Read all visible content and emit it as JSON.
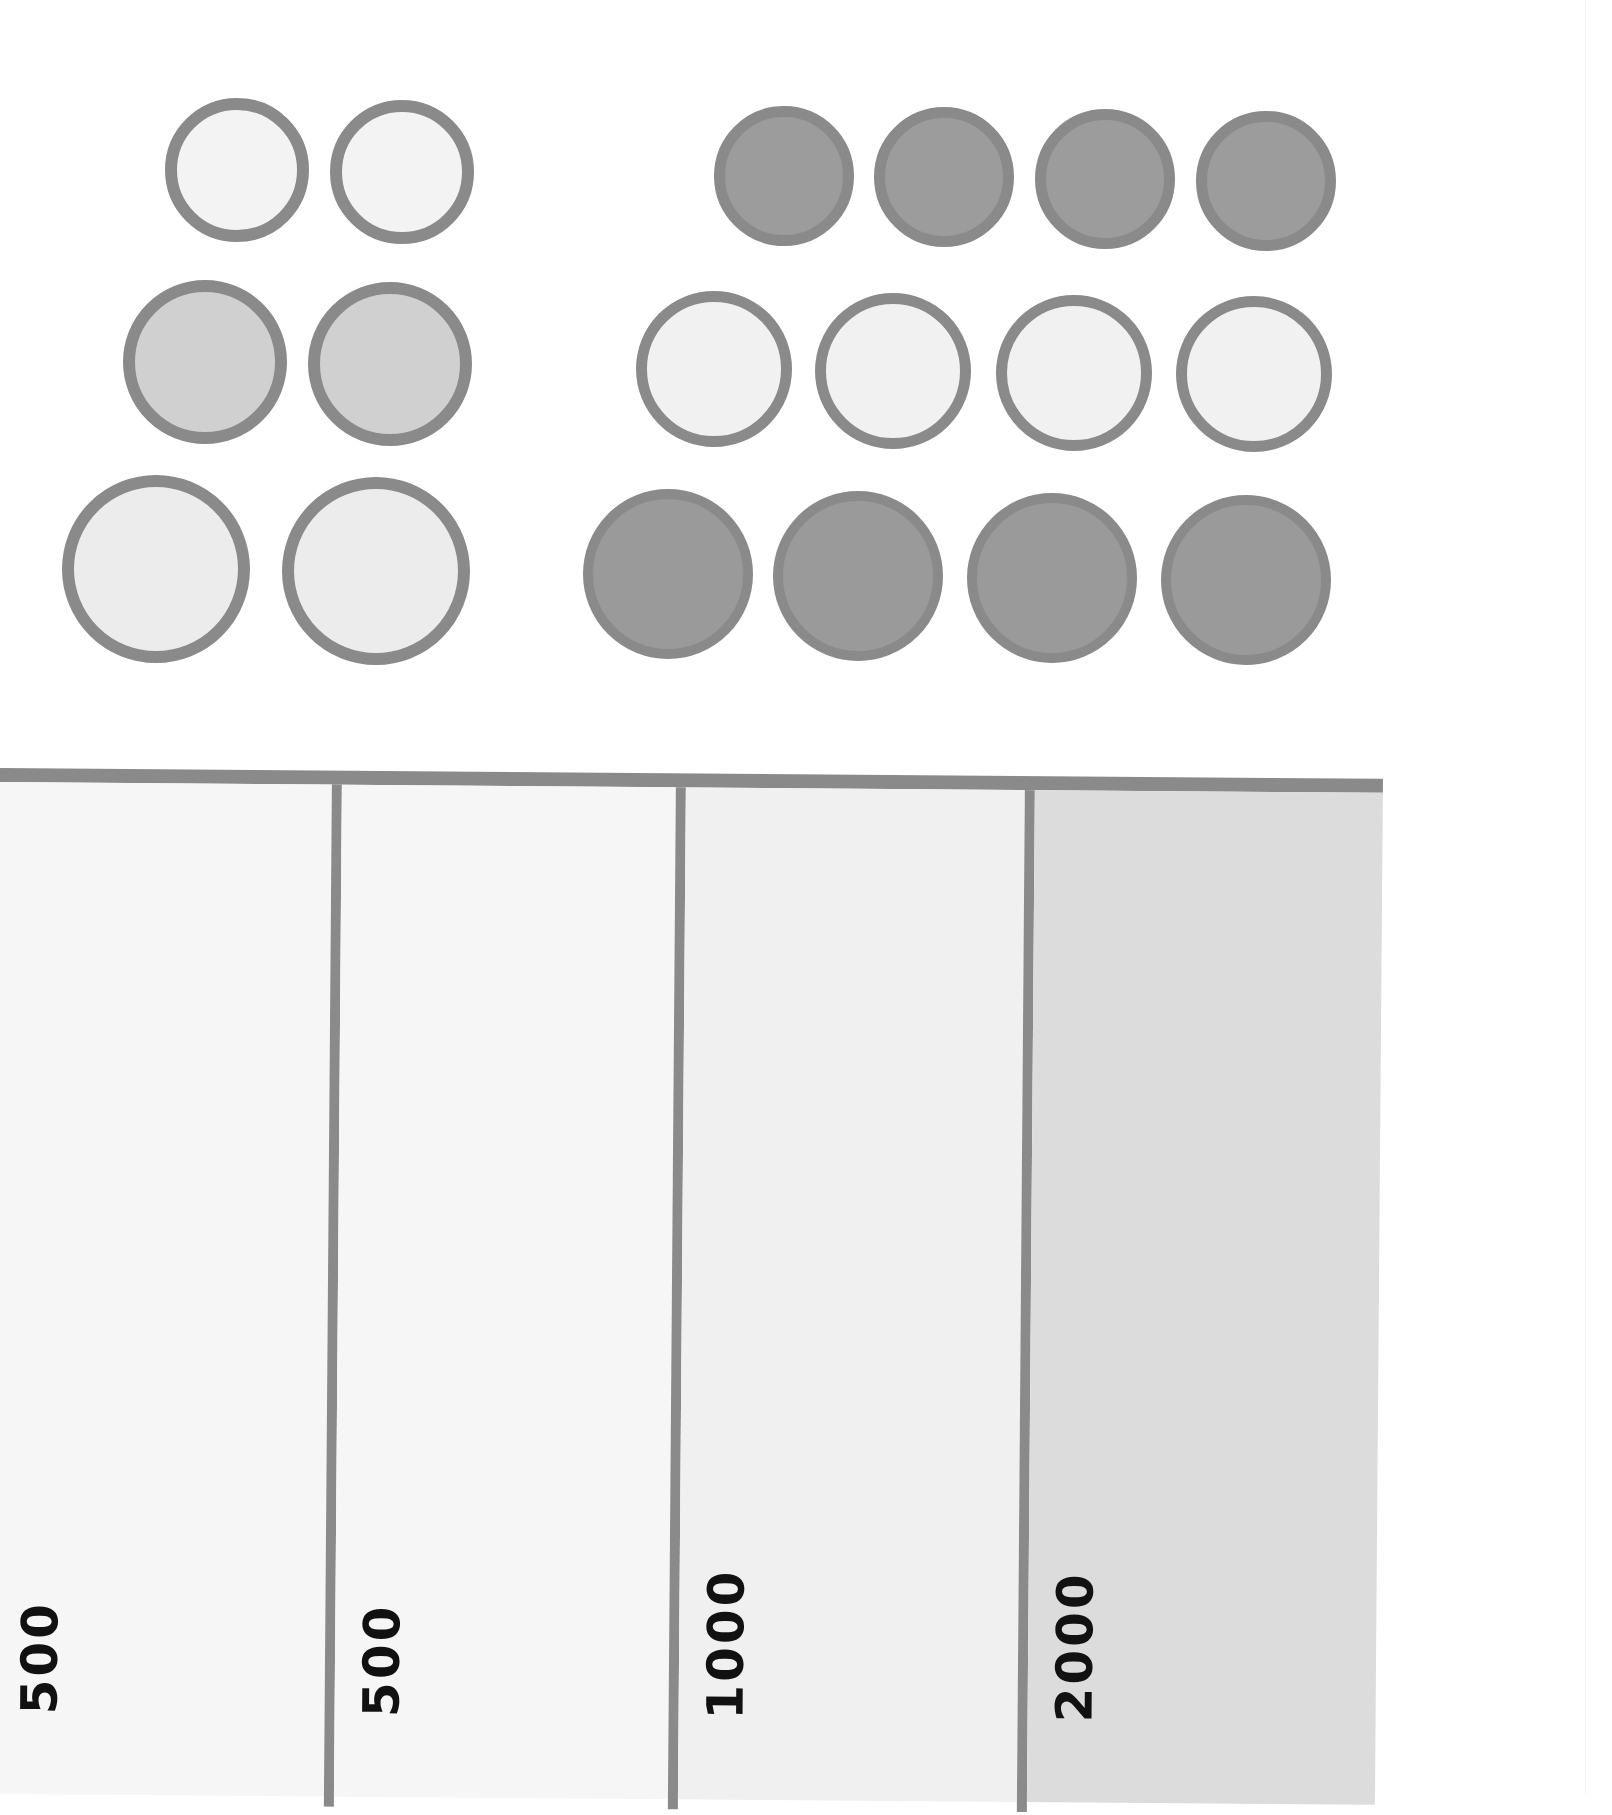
{
  "coins": {
    "border_color": "#8a8a8a",
    "left_group": [
      {
        "row": 1,
        "cx": 237,
        "cy": 170,
        "r": 72,
        "fill": "#f3f3f3",
        "border": 12
      },
      {
        "row": 1,
        "cx": 402,
        "cy": 172,
        "r": 72,
        "fill": "#f3f3f3",
        "border": 12
      },
      {
        "row": 2,
        "cx": 205,
        "cy": 362,
        "r": 82,
        "fill": "#d0d0d0",
        "border": 12
      },
      {
        "row": 2,
        "cx": 390,
        "cy": 364,
        "r": 82,
        "fill": "#d0d0d0",
        "border": 12
      },
      {
        "row": 3,
        "cx": 156,
        "cy": 569,
        "r": 94,
        "fill": "#ececec",
        "border": 12
      },
      {
        "row": 3,
        "cx": 376,
        "cy": 571,
        "r": 94,
        "fill": "#ececec",
        "border": 12
      }
    ],
    "right_group": [
      {
        "row": 1,
        "cx": 784,
        "cy": 176,
        "r": 70,
        "fill": "#9c9c9c",
        "border": 11
      },
      {
        "row": 1,
        "cx": 944,
        "cy": 177,
        "r": 70,
        "fill": "#9c9c9c",
        "border": 11
      },
      {
        "row": 1,
        "cx": 1105,
        "cy": 179,
        "r": 70,
        "fill": "#9c9c9c",
        "border": 11
      },
      {
        "row": 1,
        "cx": 1266,
        "cy": 181,
        "r": 70,
        "fill": "#9c9c9c",
        "border": 11
      },
      {
        "row": 2,
        "cx": 714,
        "cy": 369,
        "r": 78,
        "fill": "#f1f1f1",
        "border": 11
      },
      {
        "row": 2,
        "cx": 893,
        "cy": 371,
        "r": 78,
        "fill": "#f1f1f1",
        "border": 11
      },
      {
        "row": 2,
        "cx": 1074,
        "cy": 373,
        "r": 78,
        "fill": "#f1f1f1",
        "border": 11
      },
      {
        "row": 2,
        "cx": 1254,
        "cy": 374,
        "r": 78,
        "fill": "#f1f1f1",
        "border": 11
      },
      {
        "row": 3,
        "cx": 668,
        "cy": 574,
        "r": 85,
        "fill": "#9a9a9a",
        "border": 10
      },
      {
        "row": 3,
        "cx": 858,
        "cy": 576,
        "r": 85,
        "fill": "#9a9a9a",
        "border": 10
      },
      {
        "row": 3,
        "cx": 1052,
        "cy": 578,
        "r": 85,
        "fill": "#9a9a9a",
        "border": 10
      },
      {
        "row": 3,
        "cx": 1246,
        "cy": 580,
        "r": 85,
        "fill": "#9a9a9a",
        "border": 10
      }
    ]
  },
  "table": {
    "columns": [
      {
        "label": "500",
        "left": 0,
        "width": 332,
        "fill": "#f6f6f6"
      },
      {
        "label": "500",
        "left": 342,
        "width": 334,
        "fill": "#f6f6f6"
      },
      {
        "label": "1000",
        "left": 686,
        "width": 339,
        "fill": "#f0f0f0"
      },
      {
        "label": "2000",
        "left": 1035,
        "width": 348,
        "fill": "#dcdcdc"
      }
    ],
    "dividers": [
      332,
      676,
      1025
    ],
    "line_color": "#8a8a8a"
  }
}
